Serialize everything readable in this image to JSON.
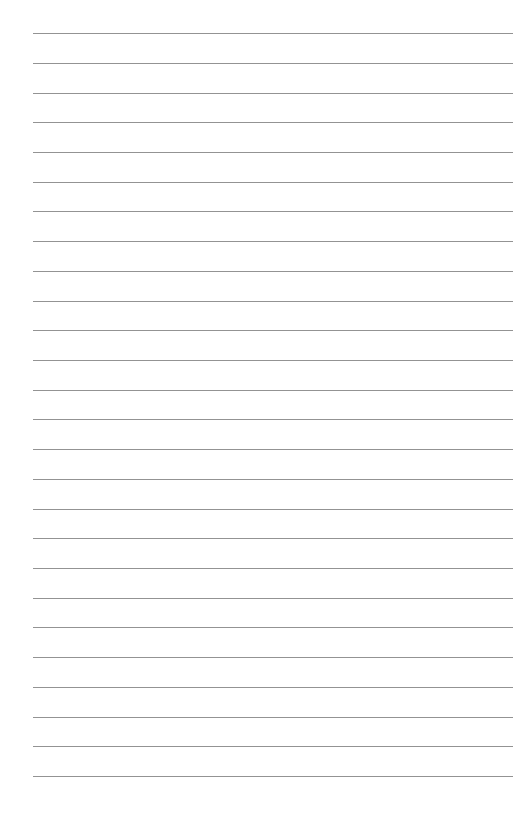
{
  "document": {
    "type": "lined-paper",
    "title": "Blank Lined Paper",
    "page_width": 529,
    "page_height": 816,
    "background_color": "#ffffff",
    "content_text": ""
  },
  "ruling": {
    "line_color": "#8a8a8a",
    "line_thickness": 1,
    "line_count": 26,
    "line_left": 33,
    "line_right": 513,
    "line_width": 480,
    "first_line_y": 33,
    "last_line_y": 776,
    "line_spacing": 29.72,
    "lines_y": [
      33,
      62.7,
      92.5,
      122.2,
      151.9,
      181.6,
      211.3,
      241.1,
      270.8,
      300.5,
      330.2,
      359.9,
      389.7,
      419.4,
      449.1,
      478.8,
      508.5,
      538.3,
      568,
      597.7,
      627.4,
      657.1,
      686.9,
      716.6,
      746.3,
      776
    ]
  }
}
